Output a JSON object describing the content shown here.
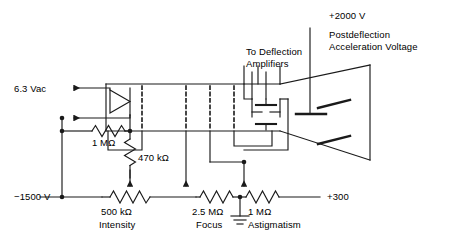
{
  "diagram": {
    "type": "schematic",
    "line_color": "#1a1a1a",
    "background": "#ffffff",
    "text_color": "#000000"
  },
  "labels": {
    "heater_supply": "6.3 Vac",
    "negative_rail": "−1500 V",
    "deflection_amplifiers_line1": "To Deflection",
    "deflection_amplifiers_line2": "Amplifiers",
    "pda_voltage": "+2000 V",
    "pda_desc_line1": "Postdeflection",
    "pda_desc_line2": "Acceleration Voltage",
    "positive_rail": "+300"
  },
  "components": [
    {
      "id": "r-1meg",
      "value": "1 MΩ",
      "function": "",
      "orientation": "horizontal",
      "kind": "resistor"
    },
    {
      "id": "r-470k",
      "value": "470 kΩ",
      "function": "",
      "orientation": "vertical",
      "kind": "potentiometer"
    },
    {
      "id": "r-500k",
      "value": "500 kΩ",
      "function": "Intensity",
      "orientation": "horizontal",
      "kind": "potentiometer"
    },
    {
      "id": "r-2meg5",
      "value": "2.5 MΩ",
      "function": "Focus",
      "orientation": "horizontal",
      "kind": "potentiometer"
    },
    {
      "id": "r-1meg-astig",
      "value": "1 MΩ",
      "function": "Astigmatism",
      "orientation": "horizontal",
      "kind": "potentiometer"
    }
  ],
  "nodes": {
    "ground_symbol": "earth-ground",
    "crt_envelope": "trapezoid-funnel",
    "deflection_plates": 4,
    "grid_electrodes": 4,
    "pda_electrode": 1
  }
}
